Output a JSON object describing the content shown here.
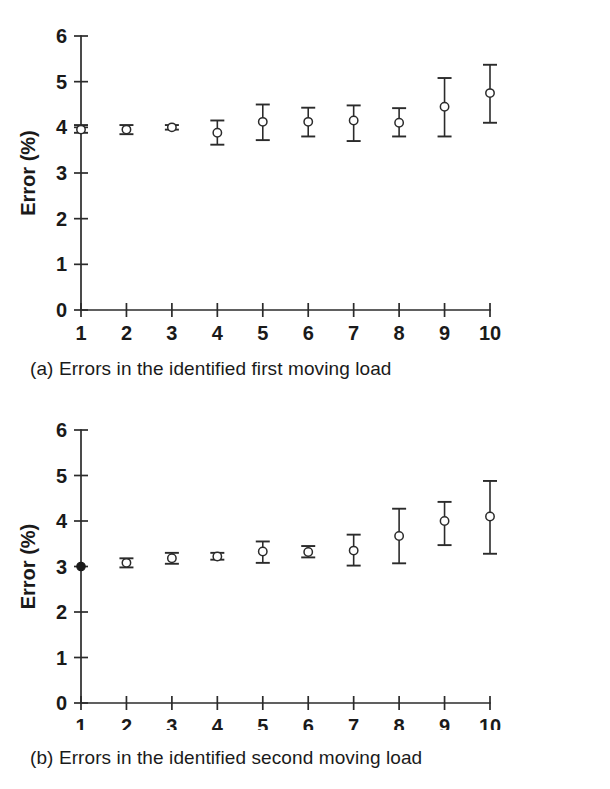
{
  "figure": {
    "panels": [
      {
        "id": "a",
        "caption": "(a) Errors in the identified first moving load",
        "chart_ref": 0
      },
      {
        "id": "b",
        "caption": "(b) Errors in the identified second moving load",
        "chart_ref": 1
      }
    ]
  },
  "chart_data": [
    {
      "type": "scatter",
      "title": "",
      "subtitle": "",
      "xlabel": "Noise level (%)",
      "ylabel": "Error (%)",
      "xlim": [
        1,
        10
      ],
      "ylim": [
        0,
        6
      ],
      "xticks": [
        1,
        2,
        3,
        4,
        5,
        6,
        7,
        8,
        9,
        10
      ],
      "xtick_labels": [
        "1",
        "2",
        "3",
        "4",
        "5",
        "6",
        "7",
        "8",
        "9",
        "10"
      ],
      "yticks": [
        0,
        1,
        2,
        3,
        4,
        5,
        6
      ],
      "ytick_labels": [
        "0",
        "1",
        "2",
        "3",
        "4",
        "5",
        "6"
      ],
      "grid": false,
      "legend": "none",
      "marker_style": "open-circle-with-errorbars",
      "x": [
        1,
        2,
        3,
        4,
        5,
        6,
        7,
        8,
        9,
        10
      ],
      "values": [
        3.95,
        3.95,
        4.0,
        3.88,
        4.12,
        4.12,
        4.15,
        4.1,
        4.45,
        4.75
      ],
      "err_low": [
        3.88,
        3.85,
        3.95,
        3.62,
        3.72,
        3.8,
        3.7,
        3.8,
        3.8,
        4.1
      ],
      "err_high": [
        4.05,
        4.05,
        4.05,
        4.15,
        4.5,
        4.43,
        4.48,
        4.42,
        5.08,
        5.37
      ],
      "filled_points": []
    },
    {
      "type": "scatter",
      "title": "",
      "subtitle": "",
      "xlabel": "Noise level (%)",
      "ylabel": "Error (%)",
      "xlim": [
        1,
        10
      ],
      "ylim": [
        0,
        6
      ],
      "xticks": [
        1,
        2,
        3,
        4,
        5,
        6,
        7,
        8,
        9,
        10
      ],
      "xtick_labels": [
        "1",
        "2",
        "3",
        "4",
        "5",
        "6",
        "7",
        "8",
        "9",
        "10"
      ],
      "yticks": [
        0,
        1,
        2,
        3,
        4,
        5,
        6
      ],
      "ytick_labels": [
        "0",
        "1",
        "2",
        "3",
        "4",
        "5",
        "6"
      ],
      "grid": false,
      "legend": "none",
      "marker_style": "open-circle-with-errorbars",
      "x": [
        1,
        2,
        3,
        4,
        5,
        6,
        7,
        8,
        9,
        10
      ],
      "values": [
        3.0,
        3.08,
        3.18,
        3.22,
        3.33,
        3.32,
        3.35,
        3.67,
        4.0,
        4.1
      ],
      "err_low": [
        3.0,
        2.98,
        3.06,
        3.15,
        3.08,
        3.2,
        3.02,
        3.07,
        3.47,
        3.28
      ],
      "err_high": [
        3.0,
        3.18,
        3.3,
        3.3,
        3.55,
        3.45,
        3.7,
        4.27,
        4.42,
        4.88
      ],
      "filled_points": [
        1
      ]
    }
  ],
  "colors": {
    "ink": "#1a1a1a",
    "axis": "#2b2b2b",
    "background": "#ffffff",
    "marker_fill": "#ffffff"
  }
}
